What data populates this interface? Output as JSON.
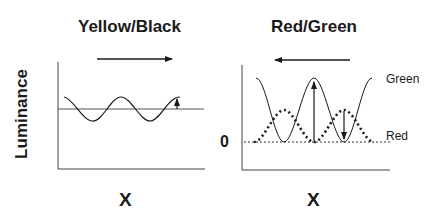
{
  "left_panel": {
    "title": "Yellow/Black",
    "y_label": "Luminance",
    "x_label": "X",
    "arrow_direction": "right",
    "curves": [
      {
        "name": "luminance-wave",
        "style": "solid",
        "description": "small-amplitude sinusoid around mean baseline"
      }
    ]
  },
  "right_panel": {
    "title": "Red/Green",
    "x_label": "X",
    "zero_label": "0",
    "arrow_direction": "left",
    "legend": {
      "green": "Green",
      "red": "Red"
    },
    "curves": [
      {
        "name": "Green",
        "style": "solid",
        "description": "large-amplitude sinusoid, troughs at zero"
      },
      {
        "name": "Red",
        "style": "dotted",
        "description": "antiphase sinusoid, smaller amplitude, troughs at zero"
      }
    ]
  },
  "colors": {
    "ink": "#1a1a1a",
    "axis": "#333333",
    "background": "#ffffff"
  }
}
